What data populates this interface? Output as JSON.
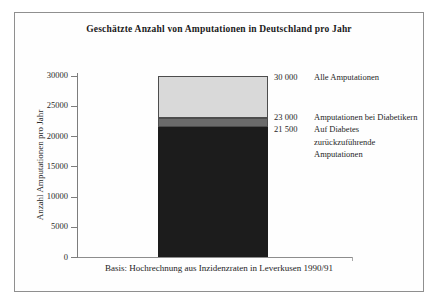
{
  "chart_data": {
    "type": "bar",
    "title": "Geschätzte Anzahl von Amputationen in Deutschland pro Jahr",
    "ylabel": "Anzahl Amputationen pro Jahr",
    "xlabel": "",
    "caption": "Basis: Hochrechnung aus Inzidenzraten in Leverkusen 1990/91",
    "ylim": [
      0,
      30000
    ],
    "yticks": [
      0,
      5000,
      10000,
      15000,
      20000,
      25000,
      30000
    ],
    "grid": false,
    "legend_position": "right-of-bar",
    "bar": {
      "stacked": true,
      "segments": [
        {
          "key": "diabetes-attributable",
          "label": "Auf Diabetes zurückzuführende Amputationen",
          "cumulative_value": 21500,
          "color": "#1c1c1c",
          "border": ""
        },
        {
          "key": "diabetic-patients",
          "label": "Amputationen bei Diabetikern",
          "cumulative_value": 23000,
          "color": "#6b6b6b",
          "border": "#4d4d4d"
        },
        {
          "key": "all-amputations",
          "label": "Alle Amputationen",
          "cumulative_value": 30000,
          "color": "#d9d9d9",
          "border": "#4d4d4d"
        }
      ]
    },
    "annotations": [
      {
        "value": "30 000",
        "label": "Alle Amputationen"
      },
      {
        "value": "23 000",
        "label": "Amputationen bei Diabetikern"
      },
      {
        "value": "21 500",
        "label": "Auf Diabetes zurückzuführende Amputationen"
      }
    ]
  }
}
